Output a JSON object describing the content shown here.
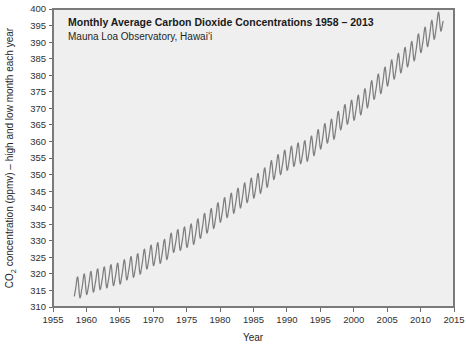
{
  "chart_data": {
    "type": "line",
    "title": "Monthly Average Carbon Dioxide Concentrations 1958 – 2013",
    "subtitle": "Mauna Loa Observatory, Hawaiʻi",
    "xlabel": "Year",
    "ylabel_prefix": "CO",
    "ylabel_sub": "2",
    "ylabel_suffix": " concentration (ppmv) – high and low month each year",
    "ylabel_full": "CO2 concentration (ppmv) – high and low month each year",
    "xlim": [
      1955,
      2015
    ],
    "ylim": [
      310,
      400
    ],
    "xticks": [
      1955,
      1960,
      1965,
      1970,
      1975,
      1980,
      1985,
      1990,
      1995,
      2000,
      2005,
      2010,
      2015
    ],
    "yticks": [
      310,
      315,
      320,
      325,
      330,
      335,
      340,
      345,
      350,
      355,
      360,
      365,
      370,
      375,
      380,
      385,
      390,
      395,
      400
    ],
    "grid": false,
    "legend": "none",
    "series_name": "Monthly mean CO2 (Keeling Curve)",
    "line_color": "#7e7e7e",
    "plot_background": "#efefef",
    "frame_color": "#7a7a7a",
    "data_start_year": 1958.2,
    "data_end_year": 2013.4,
    "seasonal_amplitude_ppm": 6.2,
    "annual_means": [
      {
        "year": 1958,
        "value": 315.3
      },
      {
        "year": 1959,
        "value": 315.9
      },
      {
        "year": 1960,
        "value": 316.9
      },
      {
        "year": 1961,
        "value": 317.6
      },
      {
        "year": 1962,
        "value": 318.4
      },
      {
        "year": 1963,
        "value": 318.9
      },
      {
        "year": 1964,
        "value": 319.6
      },
      {
        "year": 1965,
        "value": 320.0
      },
      {
        "year": 1966,
        "value": 321.3
      },
      {
        "year": 1967,
        "value": 322.1
      },
      {
        "year": 1968,
        "value": 323.0
      },
      {
        "year": 1969,
        "value": 324.6
      },
      {
        "year": 1970,
        "value": 325.6
      },
      {
        "year": 1971,
        "value": 326.3
      },
      {
        "year": 1972,
        "value": 327.4
      },
      {
        "year": 1973,
        "value": 329.6
      },
      {
        "year": 1974,
        "value": 330.2
      },
      {
        "year": 1975,
        "value": 331.1
      },
      {
        "year": 1976,
        "value": 332.0
      },
      {
        "year": 1977,
        "value": 333.8
      },
      {
        "year": 1978,
        "value": 335.4
      },
      {
        "year": 1979,
        "value": 336.8
      },
      {
        "year": 1980,
        "value": 338.7
      },
      {
        "year": 1981,
        "value": 340.1
      },
      {
        "year": 1982,
        "value": 341.4
      },
      {
        "year": 1983,
        "value": 343.0
      },
      {
        "year": 1984,
        "value": 344.6
      },
      {
        "year": 1985,
        "value": 346.0
      },
      {
        "year": 1986,
        "value": 347.4
      },
      {
        "year": 1987,
        "value": 349.2
      },
      {
        "year": 1988,
        "value": 351.6
      },
      {
        "year": 1989,
        "value": 353.1
      },
      {
        "year": 1990,
        "value": 354.4
      },
      {
        "year": 1991,
        "value": 355.6
      },
      {
        "year": 1992,
        "value": 356.4
      },
      {
        "year": 1993,
        "value": 357.1
      },
      {
        "year": 1994,
        "value": 358.8
      },
      {
        "year": 1995,
        "value": 360.8
      },
      {
        "year": 1996,
        "value": 362.6
      },
      {
        "year": 1997,
        "value": 363.7
      },
      {
        "year": 1998,
        "value": 366.6
      },
      {
        "year": 1999,
        "value": 368.3
      },
      {
        "year": 2000,
        "value": 369.5
      },
      {
        "year": 2001,
        "value": 371.1
      },
      {
        "year": 2002,
        "value": 373.2
      },
      {
        "year": 2003,
        "value": 375.8
      },
      {
        "year": 2004,
        "value": 377.5
      },
      {
        "year": 2005,
        "value": 379.8
      },
      {
        "year": 2006,
        "value": 381.9
      },
      {
        "year": 2007,
        "value": 383.8
      },
      {
        "year": 2008,
        "value": 385.6
      },
      {
        "year": 2009,
        "value": 387.4
      },
      {
        "year": 2010,
        "value": 389.9
      },
      {
        "year": 2011,
        "value": 391.7
      },
      {
        "year": 2012,
        "value": 393.9
      },
      {
        "year": 2013,
        "value": 396.5
      }
    ]
  }
}
